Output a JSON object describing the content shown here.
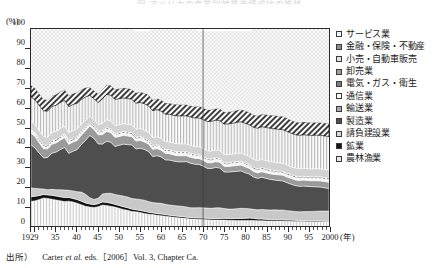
{
  "title": "図 アメリカの産業別就業者構成比の推移",
  "axis": {
    "y_unit": "(%)",
    "y_ticks": [
      0,
      10,
      20,
      30,
      40,
      50,
      60,
      70,
      80,
      90,
      100
    ],
    "x_unit": "(年)",
    "x_ticks": [
      "1929",
      "35",
      "40",
      "45",
      "50",
      "55",
      "60",
      "65",
      "70",
      "75",
      "80",
      "85",
      "90",
      "95",
      "2000"
    ]
  },
  "legend": {
    "items": [
      {
        "label": "サービス業",
        "pattern": "dots-light"
      },
      {
        "label": "金融・保険・不動産",
        "pattern": "diagonal-hatch"
      },
      {
        "label": "小売・自動車販売",
        "pattern": "vertical-lines"
      },
      {
        "label": "卸売業",
        "pattern": "solid-light-gray"
      },
      {
        "label": "電気・ガス・衛生",
        "pattern": "checker"
      },
      {
        "label": "通信業",
        "pattern": "solid-white"
      },
      {
        "label": "輸送業",
        "pattern": "solid-mid-gray"
      },
      {
        "label": "製造業",
        "pattern": "solid-dark-gray"
      },
      {
        "label": "請負建設業",
        "pattern": "solid-pale-gray"
      },
      {
        "label": "鉱業",
        "pattern": "solid-black"
      },
      {
        "label": "農林漁業",
        "pattern": "vertical-lines-light"
      }
    ]
  },
  "source": {
    "prefix": "出所）",
    "author": "Carter ",
    "italic": "et al.",
    "rest": " eds.［2006］Vol. 3, Chapter Ca."
  },
  "colors": {
    "service": "#ededed",
    "finance": "#c9c9c9",
    "retail": "#dcdcdc",
    "wholesale": "#d2d2d2",
    "utilities": "#d6d6d6",
    "communication": "#f2f2f2",
    "transport": "#9a9a9a",
    "manufacturing": "#4e4e4e",
    "construction": "#c8c8c8",
    "mining": "#111111",
    "agriculture": "#d8d8d8",
    "axis": "#2a2a2a"
  },
  "chart_data": {
    "type": "area",
    "title": "図 アメリカの産業別就業者構成比の推移",
    "xlabel": "(年)",
    "ylabel": "(%)",
    "ylim": [
      0,
      100
    ],
    "xlim": [
      1929,
      2000
    ],
    "stacked": true,
    "grid": false,
    "legend_position": "right",
    "annotations": [
      {
        "type": "vline",
        "x": 1970
      }
    ],
    "x": [
      1929,
      1930,
      1931,
      1932,
      1933,
      1934,
      1935,
      1936,
      1937,
      1938,
      1939,
      1940,
      1941,
      1942,
      1943,
      1944,
      1945,
      1946,
      1947,
      1948,
      1949,
      1950,
      1951,
      1952,
      1953,
      1954,
      1955,
      1956,
      1957,
      1958,
      1959,
      1960,
      1961,
      1962,
      1963,
      1964,
      1965,
      1966,
      1967,
      1968,
      1969,
      1970,
      1971,
      1972,
      1973,
      1974,
      1975,
      1976,
      1977,
      1978,
      1979,
      1980,
      1981,
      1982,
      1983,
      1984,
      1985,
      1986,
      1987,
      1988,
      1989,
      1990,
      1991,
      1992,
      1993,
      1994,
      1995,
      1996,
      1997,
      1998,
      1999,
      2000
    ],
    "series": [
      {
        "name": "農林漁業",
        "values": [
          12.5,
          12.8,
          13.5,
          14.2,
          14.0,
          13.6,
          13.2,
          12.8,
          12.4,
          12.6,
          12.2,
          11.6,
          10.8,
          10.0,
          9.6,
          9.4,
          9.8,
          10.6,
          10.4,
          10.0,
          9.6,
          9.0,
          8.4,
          8.0,
          7.4,
          7.2,
          6.8,
          6.4,
          6.0,
          5.8,
          5.4,
          5.2,
          5.0,
          4.7,
          4.4,
          4.2,
          4.0,
          3.8,
          3.6,
          3.5,
          3.4,
          3.3,
          3.2,
          3.1,
          3.1,
          3.0,
          3.0,
          2.9,
          2.9,
          2.8,
          2.8,
          2.8,
          2.8,
          2.8,
          2.7,
          2.7,
          2.6,
          2.6,
          2.6,
          2.5,
          2.5,
          2.4,
          2.4,
          2.3,
          2.3,
          2.3,
          2.2,
          2.2,
          2.2,
          2.1,
          2.1,
          2.0
        ]
      },
      {
        "name": "鉱業",
        "values": [
          2.4,
          2.3,
          2.0,
          1.8,
          1.8,
          2.0,
          2.0,
          2.0,
          2.1,
          1.9,
          1.8,
          1.8,
          1.8,
          1.7,
          1.6,
          1.5,
          1.5,
          1.6,
          1.6,
          1.6,
          1.4,
          1.4,
          1.4,
          1.3,
          1.2,
          1.1,
          1.1,
          1.1,
          1.0,
          0.9,
          0.9,
          0.9,
          0.8,
          0.8,
          0.8,
          0.8,
          0.8,
          0.7,
          0.7,
          0.7,
          0.7,
          0.7,
          0.7,
          0.7,
          0.7,
          0.8,
          0.9,
          0.9,
          0.9,
          1.0,
          1.0,
          1.1,
          1.2,
          1.1,
          0.9,
          0.9,
          0.8,
          0.7,
          0.7,
          0.7,
          0.7,
          0.6,
          0.6,
          0.6,
          0.5,
          0.5,
          0.5,
          0.5,
          0.5,
          0.5,
          0.4,
          0.4
        ]
      },
      {
        "name": "請負建設業",
        "values": [
          4.4,
          4.0,
          3.4,
          2.8,
          2.6,
          3.0,
          3.2,
          3.6,
          3.8,
          3.6,
          3.8,
          4.0,
          4.6,
          4.4,
          3.2,
          2.6,
          2.8,
          4.0,
          4.6,
          5.0,
          5.0,
          5.2,
          5.4,
          5.4,
          5.4,
          5.4,
          5.6,
          5.6,
          5.4,
          5.2,
          5.4,
          5.4,
          5.2,
          5.2,
          5.2,
          5.2,
          5.2,
          5.2,
          5.0,
          5.0,
          5.2,
          5.2,
          5.2,
          5.2,
          5.4,
          5.4,
          5.0,
          4.8,
          4.8,
          5.0,
          5.2,
          5.0,
          4.8,
          4.6,
          4.6,
          4.8,
          4.8,
          4.8,
          4.9,
          4.9,
          4.9,
          4.8,
          4.6,
          4.4,
          4.4,
          4.5,
          4.6,
          4.7,
          4.8,
          5.0,
          5.1,
          5.2
        ]
      },
      {
        "name": "製造業",
        "values": [
          22.0,
          20.4,
          18.0,
          15.8,
          16.4,
          18.4,
          19.2,
          20.4,
          21.6,
          18.8,
          20.2,
          21.4,
          24.2,
          27.4,
          31.6,
          31.0,
          27.6,
          25.4,
          26.4,
          26.0,
          24.4,
          25.4,
          26.4,
          26.6,
          27.2,
          25.4,
          26.0,
          25.8,
          25.4,
          23.4,
          24.0,
          23.6,
          22.6,
          22.8,
          22.6,
          22.4,
          22.6,
          23.0,
          22.6,
          22.2,
          22.0,
          21.2,
          20.2,
          20.2,
          20.6,
          20.2,
          18.6,
          18.8,
          19.0,
          19.0,
          19.0,
          18.2,
          17.6,
          16.4,
          16.0,
          16.4,
          16.0,
          15.6,
          15.2,
          15.0,
          14.8,
          14.2,
          13.6,
          13.2,
          13.0,
          13.0,
          12.8,
          12.6,
          12.4,
          12.2,
          11.8,
          11.4
        ]
      },
      {
        "name": "輸送業",
        "values": [
          6.0,
          5.8,
          5.2,
          4.6,
          4.4,
          4.6,
          4.6,
          4.8,
          5.0,
          4.6,
          4.6,
          4.6,
          4.8,
          4.8,
          4.8,
          4.6,
          4.6,
          4.8,
          5.0,
          4.8,
          4.6,
          4.4,
          4.4,
          4.4,
          4.2,
          4.0,
          4.0,
          3.8,
          3.8,
          3.6,
          3.6,
          3.4,
          3.3,
          3.2,
          3.1,
          3.1,
          3.1,
          3.0,
          3.0,
          3.0,
          3.0,
          3.0,
          2.9,
          2.9,
          2.9,
          2.9,
          2.8,
          2.8,
          2.9,
          2.9,
          3.0,
          3.0,
          2.9,
          2.8,
          2.8,
          2.8,
          2.8,
          2.8,
          2.8,
          2.9,
          2.9,
          2.9,
          2.9,
          2.9,
          2.9,
          3.0,
          3.0,
          3.0,
          3.1,
          3.1,
          3.2,
          3.2
        ]
      },
      {
        "name": "通信業",
        "values": [
          1.0,
          1.0,
          1.0,
          1.0,
          0.9,
          0.9,
          0.9,
          0.9,
          0.9,
          0.9,
          0.9,
          0.9,
          0.9,
          0.9,
          0.9,
          0.9,
          1.0,
          1.1,
          1.2,
          1.2,
          1.2,
          1.2,
          1.2,
          1.2,
          1.2,
          1.2,
          1.2,
          1.2,
          1.2,
          1.2,
          1.2,
          1.2,
          1.2,
          1.2,
          1.2,
          1.2,
          1.2,
          1.2,
          1.2,
          1.2,
          1.2,
          1.2,
          1.2,
          1.2,
          1.2,
          1.2,
          1.2,
          1.2,
          1.2,
          1.2,
          1.2,
          1.2,
          1.2,
          1.2,
          1.2,
          1.2,
          1.2,
          1.2,
          1.1,
          1.1,
          1.1,
          1.1,
          1.1,
          1.1,
          1.1,
          1.1,
          1.1,
          1.1,
          1.2,
          1.2,
          1.2,
          1.3
        ]
      },
      {
        "name": "電気・ガス・衛生",
        "values": [
          1.0,
          1.0,
          1.0,
          1.0,
          1.0,
          1.0,
          1.0,
          1.0,
          1.0,
          1.0,
          1.0,
          1.0,
          0.9,
          0.9,
          0.8,
          0.8,
          0.8,
          0.8,
          0.8,
          0.8,
          0.8,
          0.8,
          0.8,
          0.8,
          0.8,
          0.8,
          0.8,
          0.8,
          0.8,
          0.8,
          0.8,
          0.8,
          0.8,
          0.8,
          0.8,
          0.8,
          0.8,
          0.8,
          0.8,
          0.8,
          0.8,
          0.8,
          0.8,
          0.8,
          0.8,
          0.8,
          0.8,
          0.8,
          0.8,
          0.8,
          0.8,
          0.8,
          0.8,
          0.9,
          0.9,
          0.9,
          0.9,
          0.9,
          0.9,
          0.9,
          0.9,
          0.9,
          0.9,
          0.9,
          0.9,
          0.9,
          0.9,
          0.9,
          0.9,
          0.9,
          0.9,
          0.9
        ]
      },
      {
        "name": "卸売業",
        "values": [
          4.2,
          4.2,
          4.2,
          4.2,
          4.0,
          4.0,
          4.0,
          4.0,
          4.0,
          4.0,
          4.0,
          4.0,
          3.8,
          3.6,
          3.2,
          3.2,
          3.4,
          3.8,
          4.0,
          4.0,
          4.0,
          4.0,
          4.0,
          4.0,
          4.0,
          4.0,
          4.0,
          4.0,
          4.0,
          4.0,
          4.0,
          4.0,
          4.0,
          4.0,
          4.0,
          4.0,
          4.0,
          4.0,
          4.0,
          4.0,
          4.0,
          4.0,
          4.0,
          4.0,
          4.0,
          4.0,
          4.0,
          4.0,
          4.0,
          4.1,
          4.1,
          4.1,
          4.1,
          4.1,
          4.1,
          4.1,
          4.1,
          4.1,
          4.1,
          4.1,
          4.1,
          4.1,
          4.0,
          4.0,
          4.0,
          4.0,
          4.0,
          4.0,
          4.0,
          4.0,
          4.0,
          4.0
        ]
      },
      {
        "name": "小売・自動車販売",
        "values": [
          12.0,
          12.4,
          12.8,
          13.0,
          13.2,
          13.2,
          13.2,
          13.2,
          13.0,
          13.2,
          13.2,
          13.0,
          12.4,
          11.8,
          10.6,
          10.6,
          11.2,
          12.4,
          12.8,
          13.0,
          13.2,
          13.2,
          13.0,
          13.0,
          13.0,
          13.2,
          13.2,
          13.4,
          13.4,
          13.6,
          13.8,
          13.8,
          13.8,
          14.0,
          14.0,
          14.2,
          14.2,
          14.2,
          14.4,
          14.4,
          14.6,
          14.6,
          14.8,
          15.0,
          15.0,
          15.2,
          15.4,
          15.6,
          15.6,
          15.8,
          15.8,
          16.0,
          16.0,
          16.2,
          16.4,
          16.6,
          16.8,
          16.9,
          17.0,
          17.0,
          17.0,
          17.0,
          17.0,
          16.9,
          16.9,
          17.0,
          17.0,
          17.0,
          17.0,
          17.0,
          17.0,
          17.0
        ]
      },
      {
        "name": "金融・保険・不動産",
        "values": [
          6.0,
          6.0,
          6.0,
          6.0,
          5.8,
          5.6,
          5.6,
          5.6,
          5.6,
          5.6,
          5.6,
          5.6,
          5.2,
          4.8,
          4.2,
          4.2,
          4.4,
          4.8,
          5.0,
          5.0,
          5.2,
          5.2,
          5.2,
          5.2,
          5.2,
          5.4,
          5.4,
          5.4,
          5.6,
          5.6,
          5.6,
          5.8,
          5.8,
          5.8,
          5.8,
          5.8,
          5.8,
          5.8,
          5.8,
          5.8,
          6.0,
          6.0,
          6.0,
          6.0,
          6.0,
          6.2,
          6.2,
          6.2,
          6.2,
          6.2,
          6.2,
          6.4,
          6.4,
          6.4,
          6.4,
          6.4,
          6.6,
          6.8,
          6.8,
          6.8,
          6.8,
          6.8,
          6.6,
          6.6,
          6.6,
          6.6,
          6.6,
          6.6,
          6.6,
          6.6,
          6.6,
          6.6
        ]
      },
      {
        "name": "サービス業",
        "values": [
          28.5,
          30.1,
          33.9,
          35.6,
          35.9,
          33.7,
          33.1,
          31.7,
          30.6,
          33.8,
          32.7,
          32.1,
          30.6,
          29.7,
          29.5,
          31.2,
          32.9,
          30.7,
          28.2,
          28.6,
          30.6,
          30.2,
          29.8,
          30.1,
          30.4,
          31.3,
          30.9,
          31.5,
          32.4,
          35.9,
          35.3,
          35.9,
          37.5,
          37.5,
          38.1,
          38.3,
          38.3,
          38.3,
          38.9,
          39.4,
          38.1,
          39.0,
          40.0,
          39.9,
          39.3,
          39.3,
          41.1,
          41.0,
          40.7,
          40.2,
          39.9,
          40.4,
          41.2,
          43.5,
          44.0,
          43.2,
          44.4,
          45.6,
          46.0,
          46.1,
          46.3,
          47.2,
          48.3,
          49.1,
          49.4,
          49.1,
          49.3,
          49.4,
          49.3,
          49.4,
          50.7,
          52.0
        ]
      }
    ]
  }
}
